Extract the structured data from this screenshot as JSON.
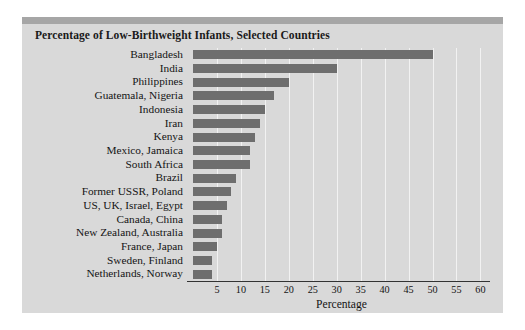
{
  "chart_data": {
    "type": "bar",
    "orientation": "horizontal",
    "title": "Percentage of Low-Birthweight Infants, Selected Countries",
    "xlabel": "Percentage",
    "ylabel": "",
    "xlim": [
      0,
      62
    ],
    "xticks": [
      5,
      10,
      15,
      20,
      25,
      30,
      35,
      40,
      45,
      50,
      55,
      60
    ],
    "grid": true,
    "legend": "none",
    "bar_color": "#6e6e6e",
    "background_color": "#d9d9d9",
    "gridline_color": "#f2f2f2",
    "categories": [
      "Bangladesh",
      "India",
      "Philippines",
      "Guatemala, Nigeria",
      "Indonesia",
      "Iran",
      "Kenya",
      "Mexico, Jamaica",
      "South Africa",
      "Brazil",
      "Former USSR, Poland",
      "US, UK, Israel, Egypt",
      "Canada, China",
      "New Zealand, Australia",
      "France, Japan",
      "Sweden, Finland",
      "Netherlands, Norway"
    ],
    "values": [
      50,
      30,
      20,
      17,
      15,
      14,
      13,
      12,
      12,
      9,
      8,
      7,
      6,
      6,
      5,
      4,
      4
    ]
  }
}
